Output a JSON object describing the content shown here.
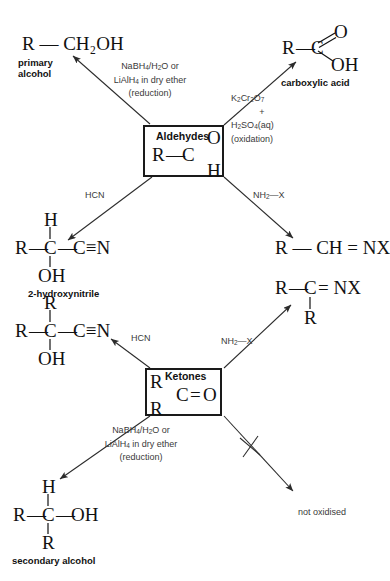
{
  "diagram": {
    "line_color": "#2b2b2b",
    "text_color": "#111111",
    "reagent_color": "#3a3a3a"
  },
  "boxes": {
    "aldehydes": {
      "title": "Aldehydes",
      "formula_r": "R",
      "formula_bond": "—",
      "formula_c": "C",
      "formula_o": "O",
      "formula_h": "H"
    },
    "ketones": {
      "title": "Ketones",
      "formula_r_top": "R",
      "formula_r_bottom": "R",
      "formula_c": "C",
      "formula_double": "=",
      "formula_o": "O"
    }
  },
  "products": {
    "primary_alcohol": {
      "formula": "R — CH₂OH",
      "caption_line1": "primary",
      "caption_line2": "alcohol"
    },
    "carboxylic_acid": {
      "formula_r": "R",
      "formula_bond": "—",
      "formula_c": "C",
      "formula_o": "O",
      "formula_oh": "OH",
      "caption": "carboxylic acid"
    },
    "hydroxynitrile_aldehyde": {
      "top": "H",
      "left": "R",
      "center": "C",
      "right": "C≡N",
      "bottom": "OH",
      "caption": "2-hydroxynitrile"
    },
    "imine_aldehyde": {
      "formula": "R — CH = NX"
    },
    "hydroxynitrile_ketone": {
      "top": "R",
      "left": "R",
      "center": "C",
      "right": "C≡N",
      "bottom": "OH"
    },
    "imine_ketone": {
      "left": "R",
      "center": "C",
      "right": "= NX",
      "bottom": "R"
    },
    "secondary_alcohol": {
      "top": "H",
      "left": "R",
      "center": "C",
      "right": "OH",
      "bottom": "R",
      "caption": "secondary alcohol"
    },
    "not_oxidised": {
      "label": "not oxidised"
    }
  },
  "reagents": {
    "reduction_aldehyde": {
      "line1_a": "NaBH",
      "line1_sub": "4",
      "line1_b": "/H",
      "line1_sub2": "2",
      "line1_c": "O or",
      "line2_a": "LiAlH",
      "line2_sub": "4",
      "line2_b": " in dry ether",
      "line3": "(reduction)"
    },
    "oxidation_aldehyde": {
      "line1_a": "K",
      "line1_sub1": "2",
      "line1_b": "Cr",
      "line1_sub2": "2",
      "line1_c": "O",
      "line1_sub3": "7",
      "line2": "+",
      "line3_a": "H",
      "line3_sub1": "2",
      "line3_b": "SO",
      "line3_sub2": "4",
      "line3_c": "(aq)",
      "line4": "(oxidation)"
    },
    "hcn_aldehyde": {
      "label": "HCN"
    },
    "nh2x_aldehyde": {
      "label_a": "NH",
      "label_sub": "2",
      "label_b": "—X"
    },
    "hcn_ketone": {
      "label": "HCN"
    },
    "nh2x_ketone": {
      "label_a": "NH",
      "label_sub": "2",
      "label_b": "—X"
    },
    "reduction_ketone": {
      "line1_a": "NaBH",
      "line1_sub": "4",
      "line1_b": "/H",
      "line1_sub2": "2",
      "line1_c": "O or",
      "line2_a": "LiAlH",
      "line2_sub": "4",
      "line2_b": " in dry ether",
      "line3": "(reduction)"
    }
  }
}
